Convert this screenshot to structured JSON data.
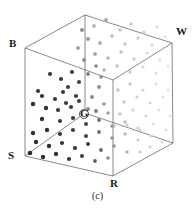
{
  "figure": {
    "caption": "(c)",
    "kind": "rgb-color-cube-scatter"
  },
  "vertices": {
    "B": {
      "label": "B",
      "name": "black-corner"
    },
    "W": {
      "label": "W",
      "name": "white-corner"
    },
    "S": {
      "label": "S",
      "name": "s-corner"
    },
    "R": {
      "label": "R",
      "name": "red-corner"
    },
    "G": {
      "label": "G",
      "name": "green-corner"
    }
  },
  "colors": {
    "edge": "#6b6b6b",
    "text": "#1a1a1a",
    "dot_dark": "#2b2b2b",
    "dot_mid": "#8a8a8a",
    "dot_light": "#cfcfcf",
    "background": "#ffffff"
  },
  "chart_data": {
    "type": "scatter",
    "title": "",
    "xlabel": "",
    "ylabel": "",
    "geometry": {
      "cube_corners_2d": {
        "top_back": [
          85,
          15
        ],
        "top_left": [
          25,
          48
        ],
        "top_right": [
          172,
          43
        ],
        "top_front": [
          113,
          80
        ],
        "bottom_back": [
          85,
          113
        ],
        "bottom_left": [
          25,
          156
        ],
        "bottom_right": [
          173,
          143
        ],
        "bottom_front": [
          113,
          176
        ]
      },
      "center_marker": {
        "x": 84,
        "y": 114,
        "r": 4.5
      }
    },
    "edges": [
      [
        "top_back",
        "top_left"
      ],
      [
        "top_back",
        "top_right"
      ],
      [
        "top_left",
        "top_front"
      ],
      [
        "top_right",
        "top_front"
      ],
      [
        "top_left",
        "bottom_left"
      ],
      [
        "top_right",
        "bottom_right"
      ],
      [
        "top_front",
        "bottom_front"
      ],
      [
        "top_back",
        "bottom_back"
      ],
      [
        "bottom_back",
        "bottom_left"
      ],
      [
        "bottom_back",
        "bottom_right"
      ],
      [
        "bottom_left",
        "bottom_front"
      ],
      [
        "bottom_right",
        "bottom_front"
      ]
    ],
    "points": [
      {
        "x": 94,
        "y": 26,
        "s": 1.9,
        "c": "#b9b9b9"
      },
      {
        "x": 106,
        "y": 20,
        "s": 1.9,
        "c": "#a8a8a8"
      },
      {
        "x": 120,
        "y": 30,
        "s": 1.8,
        "c": "#c2c2c2"
      },
      {
        "x": 131,
        "y": 24,
        "s": 1.7,
        "c": "#cdcdcd"
      },
      {
        "x": 144,
        "y": 32,
        "s": 1.7,
        "c": "#d4d4d4"
      },
      {
        "x": 157,
        "y": 27,
        "s": 1.6,
        "c": "#dcdcdc"
      },
      {
        "x": 88,
        "y": 39,
        "s": 2.0,
        "c": "#9a9a9a"
      },
      {
        "x": 100,
        "y": 43,
        "s": 1.9,
        "c": "#aeaeae"
      },
      {
        "x": 112,
        "y": 36,
        "s": 1.8,
        "c": "#bcbcbc"
      },
      {
        "x": 125,
        "y": 44,
        "s": 1.7,
        "c": "#c9c9c9"
      },
      {
        "x": 138,
        "y": 38,
        "s": 1.7,
        "c": "#d2d2d2"
      },
      {
        "x": 152,
        "y": 45,
        "s": 1.6,
        "c": "#dadada"
      },
      {
        "x": 165,
        "y": 37,
        "s": 1.6,
        "c": "#e0e0e0"
      },
      {
        "x": 95,
        "y": 54,
        "s": 1.9,
        "c": "#a4a4a4"
      },
      {
        "x": 108,
        "y": 58,
        "s": 1.8,
        "c": "#b4b4b4"
      },
      {
        "x": 121,
        "y": 52,
        "s": 1.7,
        "c": "#c4c4c4"
      },
      {
        "x": 134,
        "y": 59,
        "s": 1.7,
        "c": "#cecece"
      },
      {
        "x": 147,
        "y": 53,
        "s": 1.6,
        "c": "#d6d6d6"
      },
      {
        "x": 160,
        "y": 60,
        "s": 1.6,
        "c": "#dedede"
      },
      {
        "x": 104,
        "y": 70,
        "s": 1.8,
        "c": "#b0b0b0"
      },
      {
        "x": 117,
        "y": 66,
        "s": 1.7,
        "c": "#c0c0c0"
      },
      {
        "x": 130,
        "y": 72,
        "s": 1.7,
        "c": "#cacaca"
      },
      {
        "x": 143,
        "y": 67,
        "s": 1.6,
        "c": "#d4d4d4"
      },
      {
        "x": 156,
        "y": 73,
        "s": 1.6,
        "c": "#dcdcdc"
      },
      {
        "x": 168,
        "y": 66,
        "s": 1.5,
        "c": "#e2e2e2"
      },
      {
        "x": 72,
        "y": 72,
        "s": 2.1,
        "c": "#3c3c3c"
      },
      {
        "x": 61,
        "y": 79,
        "s": 2.1,
        "c": "#3a3a3a"
      },
      {
        "x": 50,
        "y": 74,
        "s": 2.1,
        "c": "#383838"
      },
      {
        "x": 79,
        "y": 82,
        "s": 2.1,
        "c": "#434343"
      },
      {
        "x": 68,
        "y": 87,
        "s": 2.1,
        "c": "#3e3e3e"
      },
      {
        "x": 42,
        "y": 96,
        "s": 2.1,
        "c": "#343434"
      },
      {
        "x": 55,
        "y": 99,
        "s": 2.1,
        "c": "#393939"
      },
      {
        "x": 66,
        "y": 103,
        "s": 2.1,
        "c": "#3d3d3d"
      },
      {
        "x": 76,
        "y": 96,
        "s": 2.1,
        "c": "#404040"
      },
      {
        "x": 33,
        "y": 104,
        "s": 2.2,
        "c": "#303030"
      },
      {
        "x": 46,
        "y": 108,
        "s": 2.2,
        "c": "#333333"
      },
      {
        "x": 58,
        "y": 110,
        "s": 2.1,
        "c": "#373737"
      },
      {
        "x": 71,
        "y": 107,
        "s": 2.1,
        "c": "#3b3b3b"
      },
      {
        "x": 79,
        "y": 101,
        "s": 2.1,
        "c": "#3f3f3f"
      },
      {
        "x": 38,
        "y": 91,
        "s": 2.1,
        "c": "#343434"
      },
      {
        "x": 63,
        "y": 92,
        "s": 2.1,
        "c": "#3a3a3a"
      },
      {
        "x": 88,
        "y": 74,
        "s": 1.9,
        "c": "#7d7d7d"
      },
      {
        "x": 99,
        "y": 87,
        "s": 1.9,
        "c": "#8b8b8b"
      },
      {
        "x": 92,
        "y": 97,
        "s": 1.9,
        "c": "#858585"
      },
      {
        "x": 104,
        "y": 104,
        "s": 1.8,
        "c": "#959595"
      },
      {
        "x": 88,
        "y": 109,
        "s": 1.9,
        "c": "#888888"
      },
      {
        "x": 101,
        "y": 77,
        "s": 1.8,
        "c": "#8f8f8f"
      },
      {
        "x": 96,
        "y": 66,
        "s": 1.8,
        "c": "#868686"
      },
      {
        "x": 118,
        "y": 90,
        "s": 1.7,
        "c": "#c2c2c2"
      },
      {
        "x": 130,
        "y": 84,
        "s": 1.7,
        "c": "#cbcbcb"
      },
      {
        "x": 143,
        "y": 90,
        "s": 1.6,
        "c": "#d3d3d3"
      },
      {
        "x": 156,
        "y": 84,
        "s": 1.6,
        "c": "#dbdbdb"
      },
      {
        "x": 168,
        "y": 90,
        "s": 1.5,
        "c": "#e1e1e1"
      },
      {
        "x": 124,
        "y": 102,
        "s": 1.7,
        "c": "#c6c6c6"
      },
      {
        "x": 137,
        "y": 97,
        "s": 1.6,
        "c": "#cfcfcf"
      },
      {
        "x": 150,
        "y": 103,
        "s": 1.6,
        "c": "#d7d7d7"
      },
      {
        "x": 163,
        "y": 97,
        "s": 1.5,
        "c": "#dfdfdf"
      },
      {
        "x": 120,
        "y": 114,
        "s": 1.7,
        "c": "#c8c8c8"
      },
      {
        "x": 133,
        "y": 110,
        "s": 1.6,
        "c": "#d0d0d0"
      },
      {
        "x": 146,
        "y": 116,
        "s": 1.6,
        "c": "#d8d8d8"
      },
      {
        "x": 159,
        "y": 110,
        "s": 1.5,
        "c": "#e0e0e0"
      },
      {
        "x": 170,
        "y": 116,
        "s": 1.5,
        "c": "#e4e4e4"
      },
      {
        "x": 127,
        "y": 125,
        "s": 1.6,
        "c": "#cbcbcb"
      },
      {
        "x": 140,
        "y": 130,
        "s": 1.6,
        "c": "#d4d4d4"
      },
      {
        "x": 153,
        "y": 124,
        "s": 1.5,
        "c": "#dcdcdc"
      },
      {
        "x": 166,
        "y": 130,
        "s": 1.5,
        "c": "#e2e2e2"
      },
      {
        "x": 114,
        "y": 126,
        "s": 1.7,
        "c": "#c4c4c4"
      },
      {
        "x": 60,
        "y": 121,
        "s": 2.1,
        "c": "#3a3a3a"
      },
      {
        "x": 73,
        "y": 118,
        "s": 2.1,
        "c": "#3d3d3d"
      },
      {
        "x": 86,
        "y": 124,
        "s": 2.0,
        "c": "#444444"
      },
      {
        "x": 99,
        "y": 120,
        "s": 1.9,
        "c": "#6e6e6e"
      },
      {
        "x": 112,
        "y": 126,
        "s": 1.8,
        "c": "#9a9a9a"
      },
      {
        "x": 125,
        "y": 122,
        "s": 1.7,
        "c": "#bdbdbd"
      },
      {
        "x": 138,
        "y": 128,
        "s": 1.6,
        "c": "#cfcfcf"
      },
      {
        "x": 47,
        "y": 130,
        "s": 2.2,
        "c": "#333333"
      },
      {
        "x": 60,
        "y": 134,
        "s": 2.1,
        "c": "#373737"
      },
      {
        "x": 73,
        "y": 130,
        "s": 2.1,
        "c": "#3b3b3b"
      },
      {
        "x": 86,
        "y": 136,
        "s": 2.0,
        "c": "#424242"
      },
      {
        "x": 99,
        "y": 132,
        "s": 1.9,
        "c": "#6a6a6a"
      },
      {
        "x": 112,
        "y": 138,
        "s": 1.8,
        "c": "#959595"
      },
      {
        "x": 125,
        "y": 134,
        "s": 1.7,
        "c": "#b8b8b8"
      },
      {
        "x": 138,
        "y": 140,
        "s": 1.6,
        "c": "#cbcbcb"
      },
      {
        "x": 151,
        "y": 136,
        "s": 1.6,
        "c": "#d6d6d6"
      },
      {
        "x": 36,
        "y": 142,
        "s": 2.2,
        "c": "#2e2e2e"
      },
      {
        "x": 49,
        "y": 146,
        "s": 2.2,
        "c": "#313131"
      },
      {
        "x": 62,
        "y": 143,
        "s": 2.1,
        "c": "#353535"
      },
      {
        "x": 75,
        "y": 148,
        "s": 2.1,
        "c": "#393939"
      },
      {
        "x": 88,
        "y": 144,
        "s": 2.0,
        "c": "#404040"
      },
      {
        "x": 101,
        "y": 150,
        "s": 1.9,
        "c": "#666666"
      },
      {
        "x": 114,
        "y": 146,
        "s": 1.8,
        "c": "#909090"
      },
      {
        "x": 127,
        "y": 152,
        "s": 1.7,
        "c": "#b2b2b2"
      },
      {
        "x": 30,
        "y": 153,
        "s": 2.3,
        "c": "#2b2b2b"
      },
      {
        "x": 43,
        "y": 157,
        "s": 2.2,
        "c": "#2e2e2e"
      },
      {
        "x": 56,
        "y": 154,
        "s": 2.2,
        "c": "#323232"
      },
      {
        "x": 69,
        "y": 159,
        "s": 2.1,
        "c": "#363636"
      },
      {
        "x": 82,
        "y": 156,
        "s": 2.0,
        "c": "#3c3c3c"
      },
      {
        "x": 95,
        "y": 161,
        "s": 1.9,
        "c": "#5e5e5e"
      },
      {
        "x": 108,
        "y": 158,
        "s": 1.8,
        "c": "#8a8a8a"
      },
      {
        "x": 42,
        "y": 119,
        "s": 2.2,
        "c": "#333333"
      },
      {
        "x": 33,
        "y": 133,
        "s": 2.2,
        "c": "#2f2f2f"
      },
      {
        "x": 96,
        "y": 111,
        "s": 1.9,
        "c": "#7a7a7a"
      },
      {
        "x": 108,
        "y": 113,
        "s": 1.8,
        "c": "#a5a5a5"
      },
      {
        "x": 150,
        "y": 147,
        "s": 1.6,
        "c": "#d2d2d2"
      },
      {
        "x": 162,
        "y": 142,
        "s": 1.5,
        "c": "#d9d9d9"
      },
      {
        "x": 140,
        "y": 152,
        "s": 1.6,
        "c": "#c9c9c9"
      },
      {
        "x": 82,
        "y": 30,
        "s": 2.0,
        "c": "#8f8f8f"
      },
      {
        "x": 78,
        "y": 48,
        "s": 1.9,
        "c": "#9c9c9c"
      },
      {
        "x": 84,
        "y": 60,
        "s": 1.9,
        "c": "#8c8c8c"
      }
    ]
  }
}
